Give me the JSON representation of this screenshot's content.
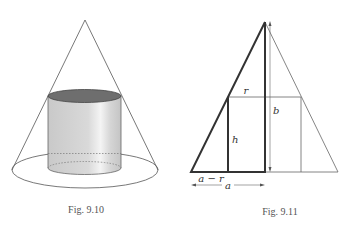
{
  "figures": [
    {
      "id": "fig-9-10",
      "caption": "Fig. 9.10",
      "description": "Cylinder inscribed in a cone"
    },
    {
      "id": "fig-9-11",
      "caption": "Fig. 9.11",
      "description": "Cross-section of cone with inscribed rectangle",
      "labels": {
        "r": "r",
        "b": "b",
        "h": "h",
        "a_minus_r": "a − r",
        "a": "a"
      }
    }
  ],
  "colors": {
    "line": "#555555",
    "thick_line": "#333333",
    "cylinder_top": "#6e6e6e",
    "cylinder_body": "#d4d4d4"
  }
}
